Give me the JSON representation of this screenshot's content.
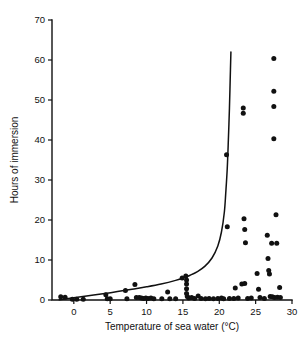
{
  "chart_data": {
    "type": "scatter",
    "title": "",
    "xlabel": "Temperature of sea water (°C)",
    "ylabel": "Hours of immersion",
    "xlim": [
      -3,
      30
    ],
    "ylim": [
      0,
      70
    ],
    "xticks": [
      0,
      5,
      10,
      15,
      20,
      25,
      30
    ],
    "yticks": [
      0,
      10,
      20,
      30,
      40,
      50,
      60,
      70
    ],
    "xtick_labels": [
      "0",
      "5",
      "10",
      "15",
      "20",
      "25",
      "30"
    ],
    "ytick_labels": [
      "0",
      "10",
      "20",
      "30",
      "40",
      "50",
      "60",
      "70"
    ],
    "grid": false,
    "legend": null,
    "marker": "filled-circle",
    "marker_color": "#111111",
    "series": [
      {
        "name": "observations",
        "type": "scatter",
        "points": [
          [
            -1.8,
            0.8
          ],
          [
            -1.2,
            0.7
          ],
          [
            -0.2,
            0.2
          ],
          [
            0.4,
            0.2
          ],
          [
            1.3,
            0.2
          ],
          [
            4.4,
            1.3
          ],
          [
            4.6,
            0.3
          ],
          [
            5.0,
            0.3
          ],
          [
            7.1,
            2.4
          ],
          [
            7.3,
            0.3
          ],
          [
            8.4,
            3.9
          ],
          [
            8.6,
            0.6
          ],
          [
            9.0,
            0.6
          ],
          [
            9.3,
            0.5
          ],
          [
            9.6,
            0.4
          ],
          [
            9.9,
            0.5
          ],
          [
            10.2,
            0.4
          ],
          [
            10.6,
            0.5
          ],
          [
            11.0,
            0.3
          ],
          [
            12.1,
            0.3
          ],
          [
            12.9,
            2.0
          ],
          [
            13.2,
            0.3
          ],
          [
            14.0,
            0.3
          ],
          [
            14.9,
            5.5
          ],
          [
            15.4,
            6.0
          ],
          [
            15.5,
            5.0
          ],
          [
            15.5,
            4.0
          ],
          [
            15.5,
            2.8
          ],
          [
            15.5,
            1.6
          ],
          [
            15.6,
            0.9
          ],
          [
            15.8,
            0.5
          ],
          [
            16.2,
            0.6
          ],
          [
            16.6,
            0.4
          ],
          [
            17.1,
            1.0
          ],
          [
            17.5,
            0.4
          ],
          [
            18.1,
            0.3
          ],
          [
            18.6,
            0.4
          ],
          [
            19.2,
            0.3
          ],
          [
            19.8,
            0.4
          ],
          [
            20.3,
            0.5
          ],
          [
            20.6,
            0.3
          ],
          [
            21.0,
            36.3
          ],
          [
            21.1,
            18.3
          ],
          [
            21.4,
            0.4
          ],
          [
            22.0,
            0.4
          ],
          [
            22.2,
            3.0
          ],
          [
            22.6,
            0.5
          ],
          [
            23.1,
            4.0
          ],
          [
            23.3,
            48.0
          ],
          [
            23.3,
            46.7
          ],
          [
            23.4,
            20.3
          ],
          [
            23.5,
            17.6
          ],
          [
            23.5,
            4.1
          ],
          [
            23.6,
            14.3
          ],
          [
            23.9,
            0.4
          ],
          [
            24.4,
            0.5
          ],
          [
            25.2,
            6.6
          ],
          [
            25.4,
            2.7
          ],
          [
            25.6,
            0.6
          ],
          [
            26.2,
            0.4
          ],
          [
            26.6,
            16.2
          ],
          [
            26.7,
            10.4
          ],
          [
            26.8,
            7.4
          ],
          [
            26.9,
            6.5
          ],
          [
            27.0,
            0.9
          ],
          [
            27.2,
            14.2
          ],
          [
            27.3,
            0.8
          ],
          [
            27.5,
            60.4
          ],
          [
            27.5,
            52.2
          ],
          [
            27.5,
            48.4
          ],
          [
            27.5,
            40.3
          ],
          [
            27.6,
            0.6
          ],
          [
            27.8,
            21.3
          ],
          [
            27.9,
            14.2
          ],
          [
            28.0,
            0.7
          ],
          [
            28.3,
            3.1
          ],
          [
            28.4,
            0.6
          ]
        ]
      },
      {
        "name": "fitted-curve",
        "type": "line",
        "points": [
          [
            -2.0,
            0.05
          ],
          [
            0.0,
            0.55
          ],
          [
            2.0,
            1.05
          ],
          [
            4.0,
            1.55
          ],
          [
            6.0,
            2.1
          ],
          [
            8.0,
            2.7
          ],
          [
            10.0,
            3.3
          ],
          [
            12.0,
            4.0
          ],
          [
            14.0,
            4.9
          ],
          [
            15.0,
            5.5
          ],
          [
            16.0,
            6.2
          ],
          [
            17.0,
            7.1
          ],
          [
            18.0,
            8.4
          ],
          [
            19.0,
            10.5
          ],
          [
            19.8,
            13.5
          ],
          [
            20.3,
            17.0
          ],
          [
            20.7,
            22.0
          ],
          [
            20.9,
            27.0
          ],
          [
            21.1,
            33.0
          ],
          [
            21.25,
            40.0
          ],
          [
            21.4,
            48.0
          ],
          [
            21.5,
            55.0
          ],
          [
            21.6,
            62.0
          ]
        ]
      }
    ]
  },
  "axes": {
    "y_axis_title": "Hours of immersion",
    "x_axis_title": "Temperature of sea water (°C)"
  }
}
